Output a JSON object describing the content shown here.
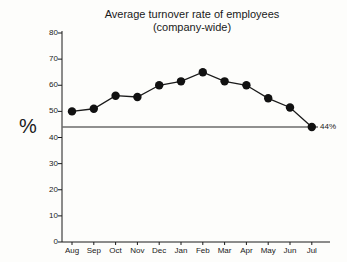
{
  "chart_data": {
    "type": "line",
    "title_line1": "Average turnover rate of employees",
    "title_line2": "(company-wide)",
    "xlabel": "",
    "ylabel": "%",
    "categories": [
      "Aug",
      "Sep",
      "Oct",
      "Nov",
      "Dec",
      "Jan",
      "Feb",
      "Mar",
      "Apr",
      "May",
      "Jun",
      "Jul"
    ],
    "values": [
      50,
      51,
      56,
      55.5,
      60,
      61.5,
      65,
      61.5,
      60,
      55,
      51.5,
      44
    ],
    "ylim": [
      0,
      80
    ],
    "ytick_labels": [
      "0",
      "10",
      "20",
      "30",
      "40",
      "50",
      "60",
      "70",
      "80"
    ],
    "yticks": [
      0,
      10,
      20,
      30,
      40,
      50,
      60,
      70,
      80
    ],
    "grid": false,
    "legend": "none",
    "marker": "filled-circle",
    "line_color": "#1a1a1a",
    "marker_color": "#111111",
    "reference_line": {
      "value": 44,
      "label": "44%",
      "color": "#6b6b6b"
    },
    "annotations": [
      {
        "text": "44%",
        "at_category": "Jul",
        "value": 44
      }
    ]
  }
}
